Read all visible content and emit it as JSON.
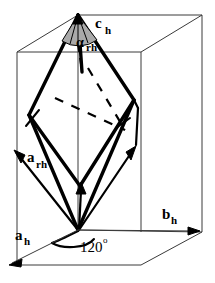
{
  "figure": {
    "type": "crystallography-diagram",
    "background_color": "#ffffff",
    "line_color": "#000000",
    "thin_line_color": "#3a3a3a",
    "shade_color": "#a9a9a9"
  },
  "labels": {
    "c_hex": {
      "symbol": "c",
      "subscript": "h"
    },
    "a_rhombo": {
      "symbol": "a",
      "subscript": "rh"
    },
    "a_hex": {
      "symbol": "a",
      "subscript": "h"
    },
    "b_hex": {
      "symbol": "b",
      "subscript": "h"
    },
    "alpha_rhombo": {
      "symbol": "α",
      "subscript": "rh"
    },
    "angle_120": {
      "value": "120",
      "unit": "o"
    }
  },
  "vectors": [
    {
      "name": "a_rh",
      "label": "a",
      "subscript": "rh",
      "direction": "up-left",
      "style": "thick-arrow"
    },
    {
      "name": "a_rh_2",
      "label": "",
      "subscript": "",
      "direction": "up",
      "style": "thick-arrow"
    },
    {
      "name": "a_rh_3",
      "label": "",
      "subscript": "",
      "direction": "up-right",
      "style": "thick-arrow"
    },
    {
      "name": "a_h",
      "label": "a",
      "subscript": "h",
      "direction": "down-left",
      "style": "thin-arrow"
    },
    {
      "name": "b_h",
      "label": "b",
      "subscript": "h",
      "direction": "right",
      "style": "thin-arrow"
    },
    {
      "name": "c_h",
      "label": "c",
      "subscript": "h",
      "direction": "up",
      "style": "thin-arrow"
    }
  ],
  "angles": [
    {
      "name": "alpha_rh",
      "text": "α",
      "sub": "rh",
      "location": "apex",
      "shaded": true
    },
    {
      "name": "gamma_120",
      "text": "120",
      "sup": "o",
      "location": "base",
      "shaded": false
    }
  ]
}
